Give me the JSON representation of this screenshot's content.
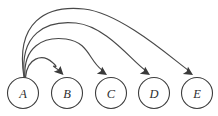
{
  "diagram": {
    "type": "node-link-diagram",
    "background_color": "#ffffff",
    "node_stroke_color": "#3d3d3d",
    "node_fill_color": "#ffffff",
    "edge_color": "#484848",
    "label_color": "#2e2e2e",
    "node_radius": 15.5,
    "nodes": [
      {
        "id": "A",
        "label": "A",
        "cx": 23,
        "cy": 93
      },
      {
        "id": "B",
        "label": "B",
        "cx": 67,
        "cy": 93
      },
      {
        "id": "C",
        "label": "C",
        "cx": 111,
        "cy": 93
      },
      {
        "id": "D",
        "label": "D",
        "cx": 154,
        "cy": 93
      },
      {
        "id": "E",
        "label": "E",
        "cx": 197,
        "cy": 93
      }
    ],
    "edges": [
      {
        "id": "edge-a-b",
        "from": "A",
        "to": "B",
        "label": "A to B",
        "path": "M 25.5 77.5 C 27 58 42 53 52.5 62.5",
        "arrow_tip_x": 63.5,
        "arrow_tip_y": 75,
        "arrow_angle_deg": 52
      },
      {
        "id": "edge-a-c",
        "from": "A",
        "to": "C",
        "label": "A to C",
        "path": "M 25 77.5 C 23 47 43 36 66 39",
        "arrow_tip_x": 107,
        "arrow_tip_y": 75,
        "arrow_angle_deg": 40
      },
      {
        "id": "edge-a-d",
        "from": "A",
        "to": "D",
        "label": "A to D",
        "path": "M 24.5 77.5 C 19 34 46 20 76 23",
        "arrow_tip_x": 150,
        "arrow_tip_y": 75,
        "arrow_angle_deg": 40
      },
      {
        "id": "edge-a-e",
        "from": "A",
        "to": "E",
        "label": "A to E",
        "path": "M 24 77.5 C 15 22 46 5 84 9",
        "arrow_tip_x": 193,
        "arrow_tip_y": 75,
        "arrow_angle_deg": 39
      }
    ]
  }
}
